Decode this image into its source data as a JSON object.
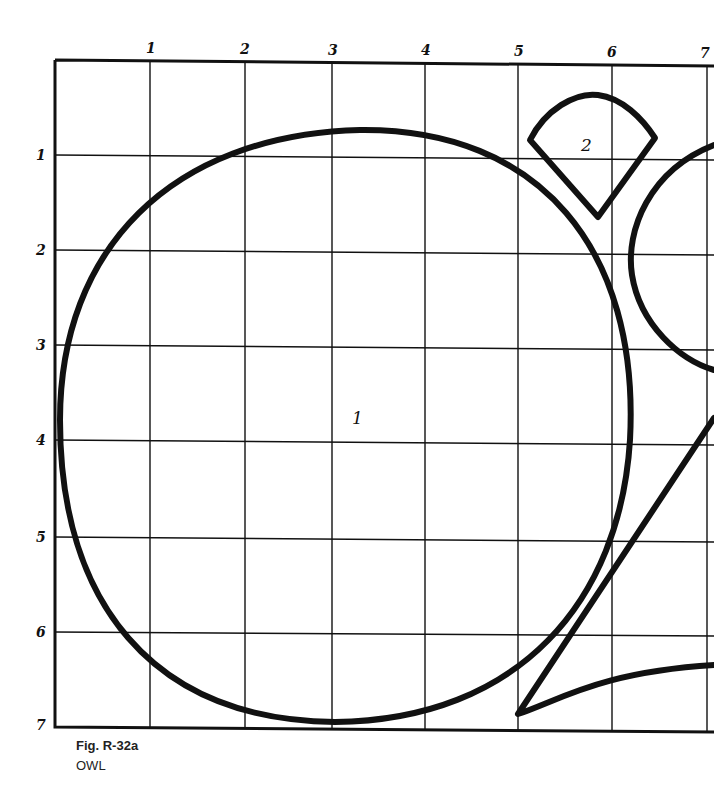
{
  "figure": {
    "caption": "Fig. R-32a",
    "title": "OWL"
  },
  "grid": {
    "x_labels": [
      "1",
      "2",
      "3",
      "4",
      "5",
      "6",
      "7"
    ],
    "y_labels": [
      "1",
      "2",
      "3",
      "4",
      "5",
      "6",
      "7"
    ]
  },
  "pieces": [
    {
      "id": "1",
      "label": "1",
      "shape": "large circle (head/body)"
    },
    {
      "id": "2",
      "label": "2",
      "shape": "fan/wedge (beak or ear)"
    }
  ],
  "colors": {
    "line": "#111111",
    "background": "#ffffff"
  }
}
